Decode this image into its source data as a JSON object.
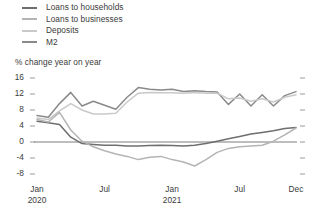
{
  "legend": {
    "items": [
      {
        "label": "Loans to households",
        "color": "#6e6e6e",
        "swatch_name": "legend-swatch-loans-households"
      },
      {
        "label": "Loans to businesses",
        "color": "#b4b4b4",
        "swatch_name": "legend-swatch-loans-businesses"
      },
      {
        "label": "Deposits",
        "color": "#c9c9c9",
        "swatch_name": "legend-swatch-deposits"
      },
      {
        "label": "M2",
        "color": "#8a8a8a",
        "swatch_name": "legend-swatch-m2"
      }
    ]
  },
  "chart_data": {
    "type": "line",
    "title": "",
    "axis_title": "% change year on year",
    "xlabel": "",
    "ylabel": "% change year on year",
    "ylim": [
      -8,
      16
    ],
    "yticks": [
      16,
      12,
      8,
      4,
      0,
      -4,
      -8
    ],
    "ytick_labels": [
      "16",
      "12",
      "8",
      "4",
      "0",
      "-4",
      "-8"
    ],
    "grid": false,
    "zero_line": true,
    "legend_position": "top-left",
    "x": [
      "Jan 2020",
      "Feb 2020",
      "Mar 2020",
      "Apr 2020",
      "May 2020",
      "Jun 2020",
      "Jul 2020",
      "Aug 2020",
      "Sep 2020",
      "Oct 2020",
      "Nov 2020",
      "Dec 2020",
      "Jan 2021",
      "Feb 2021",
      "Mar 2021",
      "Apr 2021",
      "May 2021",
      "Jun 2021",
      "Jul 2021",
      "Aug 2021",
      "Sep 2021",
      "Oct 2021",
      "Nov 2021",
      "Dec 2021"
    ],
    "xtick_positions": [
      0,
      6,
      12,
      18,
      23
    ],
    "xtick_labels": [
      {
        "month": "Jan",
        "year": "2020"
      },
      {
        "month": "Jul",
        "year": ""
      },
      {
        "month": "Jan",
        "year": "2021"
      },
      {
        "month": "Jul",
        "year": ""
      },
      {
        "month": "Dec",
        "year": ""
      }
    ],
    "series": [
      {
        "name": "M2",
        "color": "#8a8a8a",
        "values": [
          6.6,
          6.2,
          9.6,
          12.4,
          9.0,
          10.2,
          9.2,
          8.2,
          11.2,
          13.6,
          13.2,
          13.0,
          13.2,
          12.6,
          12.8,
          12.6,
          12.5,
          9.4,
          12.0,
          9.0,
          11.8,
          9.0,
          11.6,
          12.6
        ]
      },
      {
        "name": "Deposits",
        "color": "#c9c9c9",
        "values": [
          6.0,
          5.6,
          7.8,
          9.6,
          8.0,
          7.0,
          7.0,
          7.2,
          10.0,
          12.2,
          12.4,
          12.3,
          12.3,
          12.2,
          12.4,
          12.2,
          12.2,
          10.8,
          11.0,
          10.2,
          10.8,
          10.0,
          11.2,
          11.8
        ]
      },
      {
        "name": "Loans to households",
        "color": "#6e6e6e",
        "values": [
          5.2,
          4.8,
          4.4,
          1.2,
          -0.4,
          -0.6,
          -0.8,
          -0.8,
          -1.0,
          -1.0,
          -0.9,
          -0.8,
          -0.9,
          -1.0,
          -0.8,
          -0.4,
          0.2,
          0.8,
          1.4,
          2.0,
          2.4,
          2.8,
          3.4,
          3.6
        ]
      },
      {
        "name": "Loans to businesses",
        "color": "#b4b4b4",
        "values": [
          5.6,
          5.0,
          7.4,
          3.0,
          0.2,
          -1.2,
          -2.2,
          -3.0,
          -3.6,
          -4.4,
          -3.8,
          -3.6,
          -4.4,
          -5.0,
          -6.0,
          -4.4,
          -2.6,
          -1.6,
          -1.2,
          -1.0,
          -0.8,
          0.2,
          1.8,
          3.5
        ]
      }
    ]
  }
}
